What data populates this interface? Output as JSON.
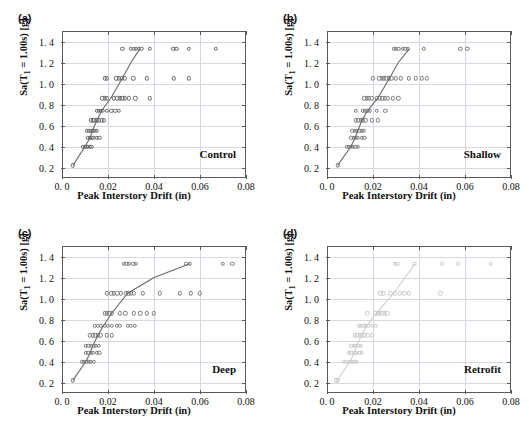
{
  "figure": {
    "panel_tags": [
      "(a)",
      "(b)",
      "(c)",
      "(d)"
    ],
    "axis": {
      "xlabel": "Peak Interstory Drift (in)",
      "ylabel_pre": "Sa(T",
      "ylabel_sub": "1",
      "ylabel_post": " = 1.00s) [g]",
      "xticklabels": [
        "0. 0",
        "0.02",
        "0.04",
        "0.06",
        "0.08"
      ],
      "xtickvalues": [
        0,
        0.02,
        0.04,
        0.06,
        0.08
      ],
      "yticklabels": [
        "0. 2",
        "0. 4",
        "0. 6",
        "0. 8",
        "1. 0",
        "1. 2",
        "1. 4"
      ],
      "ytickvalues": [
        0.2,
        0.4,
        0.6,
        0.8,
        1.0,
        1.2,
        1.4
      ],
      "xlim": [
        0,
        0.08
      ],
      "ylim": [
        0.1,
        1.5
      ]
    },
    "colors": {
      "marker_dark": "#6a6a6a",
      "marker_mid": "#7b7b7b",
      "marker_light": "#c9c9c9",
      "grid": "#d8d8e2",
      "frame": "#5a5a5a",
      "text": "#111111"
    }
  },
  "chart_data": [
    {
      "type": "scatter",
      "panel": "(a)",
      "title": "Control",
      "xlabel": "Peak Interstory Drift (in)",
      "ylabel": "Sa(T1 = 1.00s) [g]",
      "xlim": [
        0,
        0.08
      ],
      "ylim": [
        0.1,
        1.5
      ],
      "grid": true,
      "legend": "none",
      "points": [
        [
          0.0048,
          0.22
        ],
        [
          0.009,
          0.4
        ],
        [
          0.0098,
          0.4
        ],
        [
          0.0106,
          0.4
        ],
        [
          0.0113,
          0.4
        ],
        [
          0.0121,
          0.4
        ],
        [
          0.0128,
          0.4
        ],
        [
          0.0112,
          0.48
        ],
        [
          0.012,
          0.48
        ],
        [
          0.0128,
          0.48
        ],
        [
          0.0136,
          0.48
        ],
        [
          0.015,
          0.48
        ],
        [
          0.0163,
          0.48
        ],
        [
          0.0108,
          0.55
        ],
        [
          0.0118,
          0.55
        ],
        [
          0.0126,
          0.55
        ],
        [
          0.0134,
          0.55
        ],
        [
          0.0143,
          0.55
        ],
        [
          0.0152,
          0.55
        ],
        [
          0.0124,
          0.65
        ],
        [
          0.0133,
          0.65
        ],
        [
          0.0141,
          0.65
        ],
        [
          0.015,
          0.65
        ],
        [
          0.016,
          0.65
        ],
        [
          0.0172,
          0.65
        ],
        [
          0.0181,
          0.65
        ],
        [
          0.015,
          0.74
        ],
        [
          0.0159,
          0.74
        ],
        [
          0.0168,
          0.74
        ],
        [
          0.0178,
          0.74
        ],
        [
          0.0196,
          0.74
        ],
        [
          0.0215,
          0.74
        ],
        [
          0.0232,
          0.74
        ],
        [
          0.0248,
          0.74
        ],
        [
          0.0175,
          0.86
        ],
        [
          0.0185,
          0.86
        ],
        [
          0.0196,
          0.86
        ],
        [
          0.0225,
          0.86
        ],
        [
          0.024,
          0.86
        ],
        [
          0.0252,
          0.86
        ],
        [
          0.0262,
          0.86
        ],
        [
          0.0272,
          0.86
        ],
        [
          0.029,
          0.86
        ],
        [
          0.0318,
          0.86
        ],
        [
          0.0381,
          0.86
        ],
        [
          0.0186,
          1.05
        ],
        [
          0.0196,
          1.05
        ],
        [
          0.0236,
          1.05
        ],
        [
          0.0248,
          1.05
        ],
        [
          0.0259,
          1.05
        ],
        [
          0.0272,
          1.05
        ],
        [
          0.031,
          1.05
        ],
        [
          0.037,
          1.05
        ],
        [
          0.0487,
          1.05
        ],
        [
          0.0551,
          1.05
        ],
        [
          0.0262,
          1.33
        ],
        [
          0.03,
          1.33
        ],
        [
          0.0312,
          1.33
        ],
        [
          0.0322,
          1.33
        ],
        [
          0.0334,
          1.33
        ],
        [
          0.0345,
          1.33
        ],
        [
          0.0381,
          1.33
        ],
        [
          0.0484,
          1.33
        ],
        [
          0.0497,
          1.33
        ],
        [
          0.0551,
          1.33
        ],
        [
          0.0668,
          1.33
        ]
      ],
      "median_line": [
        [
          0.0048,
          0.22
        ],
        [
          0.01,
          0.4
        ],
        [
          0.0122,
          0.48
        ],
        [
          0.0132,
          0.55
        ],
        [
          0.0152,
          0.65
        ],
        [
          0.0172,
          0.74
        ],
        [
          0.0212,
          0.86
        ],
        [
          0.0262,
          1.05
        ],
        [
          0.03,
          1.2
        ],
        [
          0.0338,
          1.33
        ]
      ]
    },
    {
      "type": "scatter",
      "panel": "(b)",
      "title": "Shallow",
      "xlabel": "Peak Interstory Drift (in)",
      "ylabel": "Sa(T1 = 1.00s) [g]",
      "xlim": [
        0,
        0.08
      ],
      "ylim": [
        0.1,
        1.5
      ],
      "grid": true,
      "legend": "none",
      "points": [
        [
          0.0046,
          0.22
        ],
        [
          0.0086,
          0.4
        ],
        [
          0.0096,
          0.4
        ],
        [
          0.0104,
          0.4
        ],
        [
          0.0113,
          0.4
        ],
        [
          0.0123,
          0.4
        ],
        [
          0.0133,
          0.4
        ],
        [
          0.0106,
          0.48
        ],
        [
          0.0116,
          0.48
        ],
        [
          0.0125,
          0.48
        ],
        [
          0.0134,
          0.48
        ],
        [
          0.0152,
          0.48
        ],
        [
          0.0162,
          0.48
        ],
        [
          0.011,
          0.55
        ],
        [
          0.012,
          0.55
        ],
        [
          0.013,
          0.55
        ],
        [
          0.014,
          0.55
        ],
        [
          0.015,
          0.55
        ],
        [
          0.016,
          0.55
        ],
        [
          0.0124,
          0.65
        ],
        [
          0.0136,
          0.65
        ],
        [
          0.0146,
          0.65
        ],
        [
          0.0156,
          0.65
        ],
        [
          0.0166,
          0.65
        ],
        [
          0.0196,
          0.65
        ],
        [
          0.0222,
          0.65
        ],
        [
          0.0124,
          0.74
        ],
        [
          0.0155,
          0.74
        ],
        [
          0.0166,
          0.74
        ],
        [
          0.0176,
          0.74
        ],
        [
          0.0186,
          0.74
        ],
        [
          0.0216,
          0.74
        ],
        [
          0.0254,
          0.74
        ],
        [
          0.0162,
          0.86
        ],
        [
          0.0172,
          0.86
        ],
        [
          0.0182,
          0.86
        ],
        [
          0.0196,
          0.86
        ],
        [
          0.0216,
          0.86
        ],
        [
          0.0229,
          0.86
        ],
        [
          0.024,
          0.86
        ],
        [
          0.0252,
          0.86
        ],
        [
          0.0265,
          0.86
        ],
        [
          0.0286,
          0.86
        ],
        [
          0.031,
          0.86
        ],
        [
          0.0198,
          1.05
        ],
        [
          0.0228,
          1.05
        ],
        [
          0.0238,
          1.05
        ],
        [
          0.0248,
          1.05
        ],
        [
          0.0258,
          1.05
        ],
        [
          0.0268,
          1.05
        ],
        [
          0.028,
          1.05
        ],
        [
          0.03,
          1.05
        ],
        [
          0.032,
          1.05
        ],
        [
          0.0356,
          1.05
        ],
        [
          0.0386,
          1.05
        ],
        [
          0.0412,
          1.05
        ],
        [
          0.0434,
          1.05
        ],
        [
          0.029,
          1.33
        ],
        [
          0.03,
          1.33
        ],
        [
          0.031,
          1.33
        ],
        [
          0.033,
          1.33
        ],
        [
          0.034,
          1.33
        ],
        [
          0.0352,
          1.33
        ],
        [
          0.042,
          1.33
        ],
        [
          0.058,
          1.33
        ],
        [
          0.061,
          1.33
        ]
      ],
      "median_line": [
        [
          0.0046,
          0.22
        ],
        [
          0.0104,
          0.4
        ],
        [
          0.0122,
          0.48
        ],
        [
          0.0134,
          0.55
        ],
        [
          0.0152,
          0.65
        ],
        [
          0.0176,
          0.74
        ],
        [
          0.022,
          0.86
        ],
        [
          0.0272,
          1.05
        ],
        [
          0.031,
          1.2
        ],
        [
          0.0358,
          1.33
        ]
      ]
    },
    {
      "type": "scatter",
      "panel": "(c)",
      "title": "Deep",
      "xlabel": "Peak Interstory Drift (in)",
      "ylabel": "Sa(T1 = 1.00s) [g]",
      "xlim": [
        0,
        0.08
      ],
      "ylim": [
        0.1,
        1.5
      ],
      "grid": true,
      "legend": "none",
      "points": [
        [
          0.0047,
          0.22
        ],
        [
          0.0086,
          0.4
        ],
        [
          0.0096,
          0.4
        ],
        [
          0.0106,
          0.4
        ],
        [
          0.0116,
          0.4
        ],
        [
          0.0126,
          0.4
        ],
        [
          0.0138,
          0.4
        ],
        [
          0.0104,
          0.48
        ],
        [
          0.0114,
          0.48
        ],
        [
          0.0124,
          0.48
        ],
        [
          0.0134,
          0.48
        ],
        [
          0.015,
          0.48
        ],
        [
          0.0162,
          0.48
        ],
        [
          0.0104,
          0.55
        ],
        [
          0.0115,
          0.55
        ],
        [
          0.0126,
          0.55
        ],
        [
          0.0137,
          0.55
        ],
        [
          0.0148,
          0.55
        ],
        [
          0.016,
          0.55
        ],
        [
          0.0122,
          0.65
        ],
        [
          0.0133,
          0.65
        ],
        [
          0.0144,
          0.65
        ],
        [
          0.0155,
          0.65
        ],
        [
          0.0166,
          0.65
        ],
        [
          0.0196,
          0.65
        ],
        [
          0.0216,
          0.65
        ],
        [
          0.0142,
          0.74
        ],
        [
          0.0156,
          0.74
        ],
        [
          0.0168,
          0.74
        ],
        [
          0.0186,
          0.74
        ],
        [
          0.02,
          0.74
        ],
        [
          0.0216,
          0.74
        ],
        [
          0.0238,
          0.74
        ],
        [
          0.0252,
          0.74
        ],
        [
          0.0286,
          0.74
        ],
        [
          0.03,
          0.74
        ],
        [
          0.0316,
          0.74
        ],
        [
          0.0186,
          0.86
        ],
        [
          0.0196,
          0.86
        ],
        [
          0.0206,
          0.86
        ],
        [
          0.0216,
          0.86
        ],
        [
          0.0252,
          0.86
        ],
        [
          0.0276,
          0.86
        ],
        [
          0.0312,
          0.86
        ],
        [
          0.034,
          0.86
        ],
        [
          0.037,
          0.86
        ],
        [
          0.04,
          0.86
        ],
        [
          0.0196,
          1.05
        ],
        [
          0.0214,
          1.05
        ],
        [
          0.0226,
          1.05
        ],
        [
          0.024,
          1.05
        ],
        [
          0.0256,
          1.05
        ],
        [
          0.0278,
          1.05
        ],
        [
          0.0288,
          1.05
        ],
        [
          0.03,
          1.05
        ],
        [
          0.0312,
          1.05
        ],
        [
          0.0352,
          1.05
        ],
        [
          0.0424,
          1.05
        ],
        [
          0.0512,
          1.05
        ],
        [
          0.056,
          1.05
        ],
        [
          0.06,
          1.05
        ],
        [
          0.0268,
          1.33
        ],
        [
          0.028,
          1.33
        ],
        [
          0.029,
          1.33
        ],
        [
          0.031,
          1.33
        ],
        [
          0.0322,
          1.33
        ],
        [
          0.054,
          1.33
        ],
        [
          0.0556,
          1.33
        ],
        [
          0.07,
          1.33
        ],
        [
          0.074,
          1.33
        ]
      ],
      "median_line": [
        [
          0.0047,
          0.22
        ],
        [
          0.0104,
          0.4
        ],
        [
          0.0122,
          0.48
        ],
        [
          0.0134,
          0.55
        ],
        [
          0.0156,
          0.65
        ],
        [
          0.018,
          0.74
        ],
        [
          0.0216,
          0.86
        ],
        [
          0.0286,
          1.05
        ],
        [
          0.04,
          1.2
        ],
        [
          0.0556,
          1.33
        ]
      ]
    },
    {
      "type": "scatter",
      "panel": "(d)",
      "title": "Retrofit",
      "xlabel": "Peak Interstory Drift (in)",
      "ylabel": "Sa(T1 = 1.00s) [g]",
      "xlim": [
        0,
        0.08
      ],
      "ylim": [
        0.1,
        1.5
      ],
      "grid": true,
      "legend": "none",
      "points": [
        [
          0.004,
          0.22
        ],
        [
          0.0048,
          0.22
        ],
        [
          0.0074,
          0.4
        ],
        [
          0.0086,
          0.4
        ],
        [
          0.0098,
          0.4
        ],
        [
          0.0108,
          0.4
        ],
        [
          0.0118,
          0.4
        ],
        [
          0.013,
          0.4
        ],
        [
          0.0094,
          0.48
        ],
        [
          0.0106,
          0.48
        ],
        [
          0.0118,
          0.48
        ],
        [
          0.0128,
          0.48
        ],
        [
          0.014,
          0.48
        ],
        [
          0.015,
          0.48
        ],
        [
          0.0106,
          0.55
        ],
        [
          0.0116,
          0.55
        ],
        [
          0.0126,
          0.55
        ],
        [
          0.0136,
          0.55
        ],
        [
          0.0146,
          0.55
        ],
        [
          0.0122,
          0.65
        ],
        [
          0.0132,
          0.65
        ],
        [
          0.0142,
          0.65
        ],
        [
          0.0152,
          0.65
        ],
        [
          0.0162,
          0.65
        ],
        [
          0.0176,
          0.65
        ],
        [
          0.0194,
          0.65
        ],
        [
          0.0138,
          0.74
        ],
        [
          0.0148,
          0.74
        ],
        [
          0.0158,
          0.74
        ],
        [
          0.0168,
          0.74
        ],
        [
          0.018,
          0.74
        ],
        [
          0.02,
          0.74
        ],
        [
          0.0212,
          0.74
        ],
        [
          0.0176,
          0.86
        ],
        [
          0.021,
          0.86
        ],
        [
          0.022,
          0.86
        ],
        [
          0.023,
          0.86
        ],
        [
          0.024,
          0.86
        ],
        [
          0.0252,
          0.86
        ],
        [
          0.0262,
          0.86
        ],
        [
          0.0232,
          1.05
        ],
        [
          0.0244,
          1.05
        ],
        [
          0.0276,
          1.05
        ],
        [
          0.0296,
          1.05
        ],
        [
          0.0316,
          1.05
        ],
        [
          0.0336,
          1.05
        ],
        [
          0.0356,
          1.05
        ],
        [
          0.0492,
          1.05
        ],
        [
          0.0294,
          1.33
        ],
        [
          0.0306,
          1.33
        ],
        [
          0.038,
          1.33
        ],
        [
          0.05,
          1.33
        ],
        [
          0.057,
          1.33
        ],
        [
          0.0712,
          1.33
        ]
      ],
      "median_line": [
        [
          0.0044,
          0.22
        ],
        [
          0.01,
          0.4
        ],
        [
          0.0118,
          0.48
        ],
        [
          0.013,
          0.55
        ],
        [
          0.015,
          0.65
        ],
        [
          0.0172,
          0.74
        ],
        [
          0.0215,
          0.86
        ],
        [
          0.029,
          1.05
        ],
        [
          0.034,
          1.2
        ],
        [
          0.0382,
          1.33
        ]
      ]
    }
  ]
}
